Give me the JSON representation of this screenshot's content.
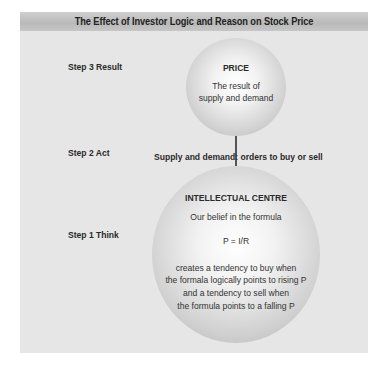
{
  "title": "The Effect of Investor Logic and Reason on Stock Price",
  "steps": [
    {
      "label": "Step 3 Result"
    },
    {
      "label": "Step 2 Act"
    },
    {
      "label": "Step 1 Think"
    }
  ],
  "price_circle": {
    "heading": "PRICE",
    "line1": "The result of",
    "line2": "supply and demand"
  },
  "act_text": "Supply and demand: orders to buy or sell",
  "intellectual_circle": {
    "heading": "INTELLECTUAL CENTRE",
    "line1": "Our belief in the formula",
    "formula": "P = I/R",
    "line2": "creates a tendency to buy when",
    "line3": "the formala logically points to rising P",
    "line4": "and a tendency to sell when",
    "line5": "the formula points to a falling P"
  },
  "colors": {
    "panel_background": "#e6e6e6",
    "title_bar": "#c2c2c2",
    "text": "#2a2a2a",
    "connector": "#555555"
  }
}
